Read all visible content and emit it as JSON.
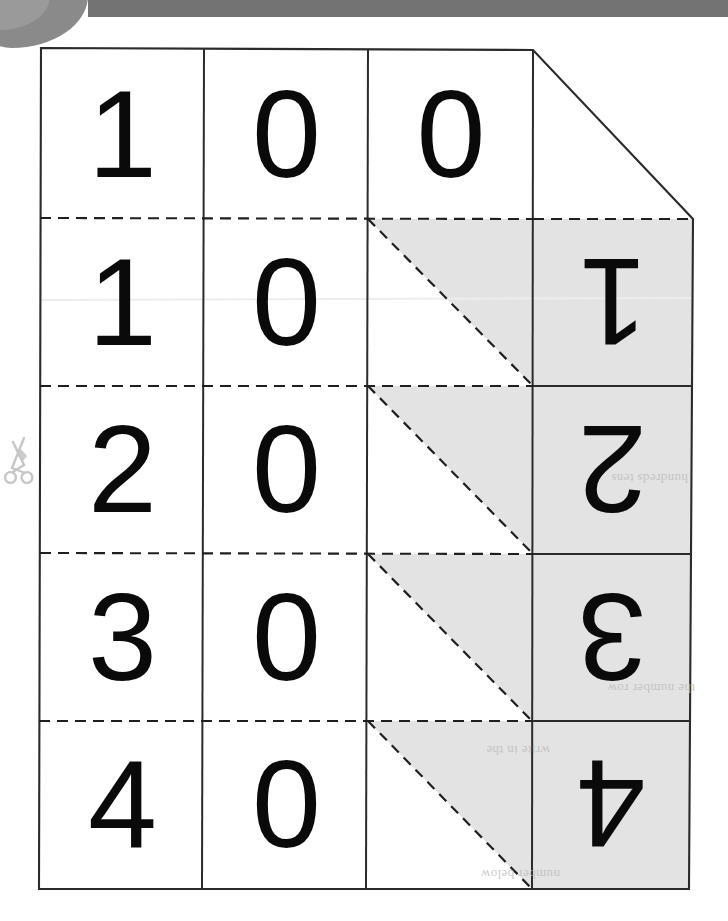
{
  "document": {
    "kind": "scanned-worksheet",
    "title": "Number cards fold-over grid",
    "page_background": "#ffffff",
    "ink_color": "#0a0a0a"
  },
  "scan_artifacts": {
    "top_bar_label": "scanner-edge-bar",
    "top_bar_color": "#737373",
    "corner_blob_label": "scanner-corner-shadow",
    "corner_blob_color": "#8a8a8a"
  },
  "cut_marker": {
    "icon": "scissors-icon",
    "color": "#9a9a9a"
  },
  "grid": {
    "border_color": "#2b2b2b",
    "dashed_color": "#1f1f1f",
    "shade_color": "#e3e3e3",
    "columns": 4,
    "rows": 5,
    "column_headers": [
      "col-1",
      "col-2",
      "col-3",
      "col-4"
    ],
    "rows_data": [
      {
        "row": 1,
        "cells": [
          "1",
          "0",
          "0",
          ""
        ],
        "shaded": [
          false,
          false,
          false,
          false
        ],
        "diagonal": "none",
        "top_edge": "solid",
        "note": "corner-clipped row"
      },
      {
        "row": 2,
        "cells": [
          "1",
          "0",
          "",
          "1"
        ],
        "flipped": [
          false,
          false,
          false,
          true
        ],
        "shaded": [
          false,
          false,
          "upper-right-triangle",
          true
        ],
        "diagonal": "dashed",
        "top_edge": "dashed"
      },
      {
        "row": 3,
        "cells": [
          "2",
          "0",
          "",
          "2"
        ],
        "flipped": [
          false,
          false,
          false,
          true
        ],
        "shaded": [
          false,
          false,
          "upper-right-triangle",
          true
        ],
        "diagonal": "dashed",
        "top_edge": "dashed"
      },
      {
        "row": 4,
        "cells": [
          "3",
          "0",
          "",
          "3"
        ],
        "flipped": [
          false,
          false,
          false,
          true
        ],
        "shaded": [
          false,
          false,
          "upper-right-triangle",
          true
        ],
        "diagonal": "dashed",
        "top_edge": "dashed"
      },
      {
        "row": 5,
        "cells": [
          "4",
          "0",
          "",
          "4"
        ],
        "flipped": [
          false,
          false,
          false,
          true
        ],
        "shaded": [
          false,
          false,
          "upper-right-triangle",
          true
        ],
        "diagonal": "dashed",
        "top_edge": "dashed"
      }
    ]
  },
  "digits": {
    "r1c1": "1",
    "r1c2": "0",
    "r1c3": "0",
    "r2c1": "1",
    "r2c2": "0",
    "r2c4": "1",
    "r3c1": "2",
    "r3c2": "0",
    "r3c4": "2",
    "r4c1": "3",
    "r4c2": "0",
    "r4c4": "3",
    "r5c1": "4",
    "r5c2": "0",
    "r5c4": "4"
  },
  "showthrough": {
    "g1": "hundreds tens",
    "g2": "the number row",
    "g3": "write in the",
    "g4": "number below"
  }
}
